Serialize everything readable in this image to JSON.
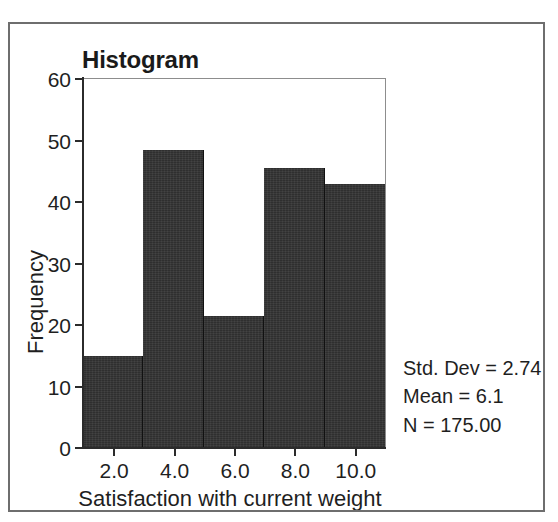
{
  "figure": {
    "title": "Histogram"
  },
  "stats": {
    "std_dev": "Std. Dev = 2.74",
    "mean": "Mean = 6.1",
    "n": "N = 175.00"
  },
  "axes": {
    "x_title": "Satisfaction with current weight",
    "y_title": "Frequency",
    "x_ticks": [
      "2.0",
      "4.0",
      "6.0",
      "8.0",
      "10.0"
    ],
    "y_ticks": [
      "0",
      "10",
      "20",
      "30",
      "40",
      "50",
      "60"
    ]
  },
  "colors": {
    "bar_fill": "#2f2f2f",
    "axis": "#2b2b2b",
    "frame": "#6e6e6e",
    "text": "#1f1f1f"
  },
  "chart_data": {
    "type": "bar",
    "title": "Histogram",
    "xlabel": "Satisfaction with current weight",
    "ylabel": "Frequency",
    "xlim": [
      1,
      11
    ],
    "ylim": [
      0,
      60
    ],
    "grid": false,
    "legend": false,
    "bin_width": 2,
    "bin_edges": [
      1,
      3,
      5,
      7,
      9,
      11
    ],
    "bin_centers": [
      2,
      4,
      6,
      8,
      10
    ],
    "categories": [
      "1-3",
      "3-5",
      "5-7",
      "7-9",
      "9-11"
    ],
    "values": [
      15,
      48.5,
      21.5,
      45.5,
      43
    ],
    "x_tick_values": [
      2,
      4,
      6,
      8,
      10
    ],
    "x_tick_labels": [
      "2.0",
      "4.0",
      "6.0",
      "8.0",
      "10.0"
    ],
    "y_tick_values": [
      0,
      10,
      20,
      30,
      40,
      50,
      60
    ],
    "y_tick_labels": [
      "0",
      "10",
      "20",
      "30",
      "40",
      "50",
      "60"
    ],
    "annotations": [
      "Std. Dev = 2.74",
      "Mean = 6.1",
      "N = 175.00"
    ],
    "summary": {
      "std_dev": 2.74,
      "mean": 6.1,
      "n": 175.0
    }
  }
}
